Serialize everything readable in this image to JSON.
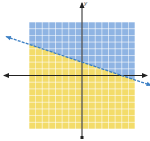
{
  "chart_data": {
    "type": "area",
    "title": "",
    "xlabel": "x",
    "ylabel": "y",
    "boundary_line": {
      "slope": -0.3333,
      "intercept": 2,
      "style": "dashed",
      "color": "#3b7fc4"
    },
    "regions": [
      {
        "name": "above",
        "color": "#8fb4e3"
      },
      {
        "name": "below",
        "color": "#f3dc6a"
      }
    ],
    "xlim": [
      -8,
      8
    ],
    "ylim": [
      -8,
      8
    ],
    "grid": true,
    "grid_color": "#ffffff",
    "axis_arrows": true
  },
  "labels": {
    "y_axis": "y"
  }
}
